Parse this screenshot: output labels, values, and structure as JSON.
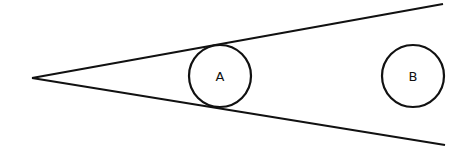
{
  "diagram": {
    "type": "wedge-with-circles",
    "apex": {
      "x": 32,
      "y": 78
    },
    "upper_line_end": {
      "x": 443,
      "y": 4
    },
    "lower_line_end": {
      "x": 445,
      "y": 145
    },
    "stroke_color": "#111111",
    "circles": [
      {
        "label": "A",
        "cx": 220,
        "cy": 76,
        "r": 31,
        "tangent_to_wedge": true
      },
      {
        "label": "B",
        "cx": 413,
        "cy": 76,
        "r": 31,
        "tangent_to_wedge": false
      }
    ]
  }
}
